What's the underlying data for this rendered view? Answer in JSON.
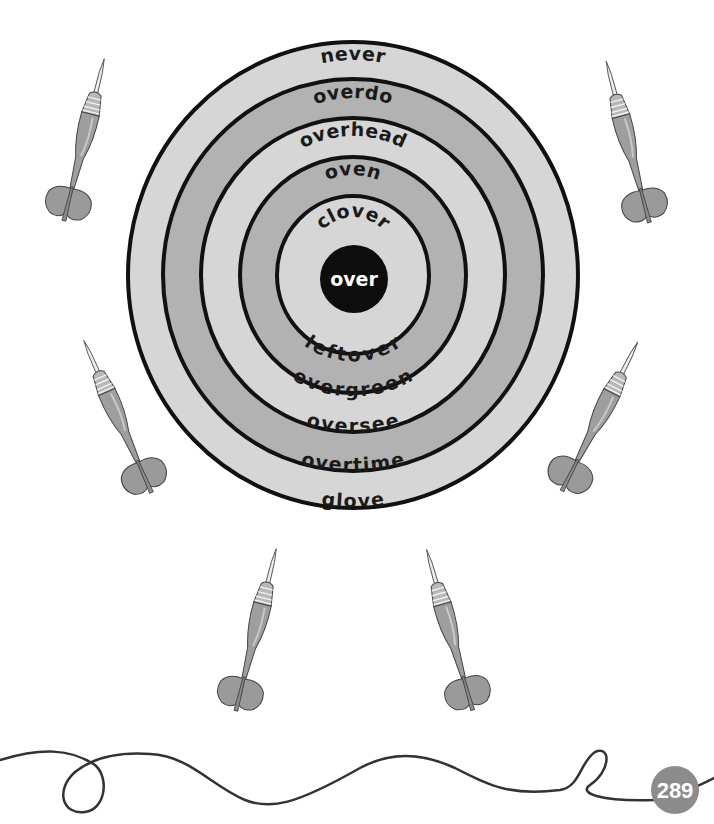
{
  "worksheet": {
    "center_word": "over",
    "rings_outer_to_inner": [
      {
        "id": "ring1",
        "shade": "light",
        "top_word": "never",
        "bottom_word": "glove"
      },
      {
        "id": "ring2",
        "shade": "medium",
        "top_word": "overdo",
        "bottom_word": "overtime"
      },
      {
        "id": "ring3",
        "shade": "light",
        "top_word": "overhead",
        "bottom_word": "oversee"
      },
      {
        "id": "ring4",
        "shade": "medium",
        "top_word": "oven",
        "bottom_word": "evergreen"
      },
      {
        "id": "ring5",
        "shade": "light",
        "top_word": "clover",
        "bottom_word": "leftover"
      }
    ],
    "darts_count": 6,
    "page_number": "289"
  },
  "colors": {
    "ring_light": "#d6d6d6",
    "ring_medium": "#b2b2b2",
    "ring_line": "#111111",
    "bullseye": "#0d0d0d",
    "dart_body": "#9e9e9e",
    "dart_flight": "#9a9a9a",
    "dart_tip": "#e8e8e8",
    "badge": "#8c8c8c",
    "string_line": "#333333"
  }
}
